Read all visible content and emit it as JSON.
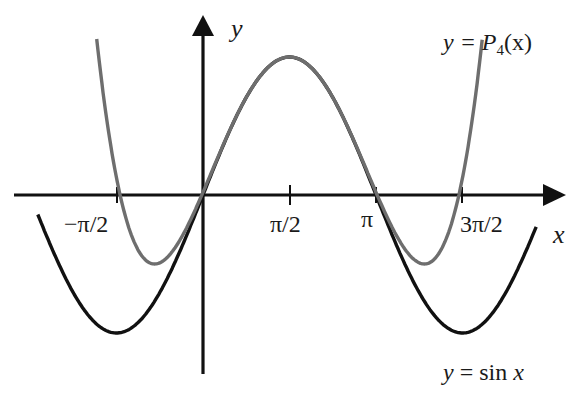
{
  "chart_data": {
    "type": "line",
    "title": "",
    "xlabel": "x",
    "ylabel": "y",
    "xlim": [
      -2.94,
      4.84
    ],
    "ylim": [
      -1.3,
      1.15
    ],
    "grid": false,
    "x_ticks": [
      {
        "value": -1.5708,
        "label": "−π/2"
      },
      {
        "value": 1.5708,
        "label": "π/2"
      },
      {
        "value": 3.1416,
        "label": "π"
      },
      {
        "value": 4.7124,
        "label": "3π/2"
      }
    ],
    "series": [
      {
        "name": "y = sin x",
        "function": "sin(x)",
        "color": "#111111",
        "x_range": [
          -3.0,
          6.05
        ],
        "points": [
          {
            "x": -1.5708,
            "y": -1
          },
          {
            "x": 0,
            "y": 0
          },
          {
            "x": 1.5708,
            "y": 1
          },
          {
            "x": 3.1416,
            "y": 0
          },
          {
            "x": 4.7124,
            "y": -1
          }
        ]
      },
      {
        "name": "y = P4(x)",
        "function": "1 - (x-π/2)^2/2 + (x-π/2)^4/24",
        "color": "#6e6e6e",
        "x_range": [
          -1.93,
          5.07
        ],
        "points": [
          {
            "x": -0.878,
            "y": -0.5
          },
          {
            "x": 0,
            "y": 0.02
          },
          {
            "x": 1.5708,
            "y": 1
          },
          {
            "x": 3.1416,
            "y": 0.02
          },
          {
            "x": 4.02,
            "y": -0.5
          }
        ]
      }
    ],
    "annotations": [
      {
        "text_pre": "y = ",
        "text_fn": "P",
        "text_sub": "4",
        "text_post": "(x)",
        "position": "top-right"
      },
      {
        "text": "y = sin x",
        "position": "bottom-right"
      }
    ]
  },
  "labels": {
    "x_axis": "x",
    "y_axis": "y",
    "p4_pre": "y = ",
    "p4_fn": "P",
    "p4_sub": "4",
    "p4_post": "(x)",
    "sin_label_y": "y",
    "sin_label_rest": " = sin ",
    "sin_label_x": "x",
    "tick_neg_half_pi": "−π/2",
    "tick_half_pi": "π/2",
    "tick_pi": "π",
    "tick_three_half_pi": "3π/2"
  }
}
